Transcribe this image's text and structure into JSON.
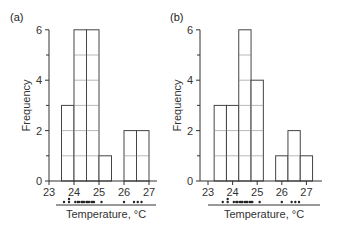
{
  "chart_data": [
    {
      "type": "bar",
      "panel_label": "(a)",
      "title": "",
      "xlabel": "Temperature, °C",
      "ylabel": "Frequency",
      "xticks": [
        23,
        24,
        25,
        26,
        27
      ],
      "yticks": [
        0,
        2,
        4,
        6
      ],
      "ylim": [
        0,
        6
      ],
      "xlim": [
        23,
        27.3
      ],
      "bin_width": 0.5,
      "bins": [
        {
          "start": 23.5,
          "end": 24.0,
          "count": 3
        },
        {
          "start": 24.0,
          "end": 24.5,
          "count": 6
        },
        {
          "start": 24.5,
          "end": 25.0,
          "count": 6
        },
        {
          "start": 25.0,
          "end": 25.5,
          "count": 1
        },
        {
          "start": 25.5,
          "end": 26.0,
          "count": 0
        },
        {
          "start": 26.0,
          "end": 26.5,
          "count": 2
        },
        {
          "start": 26.5,
          "end": 27.0,
          "count": 2
        }
      ],
      "rug_points": [
        23.6,
        23.8,
        23.8,
        24.05,
        24.15,
        24.2,
        24.3,
        24.35,
        24.4,
        24.5,
        24.55,
        24.6,
        24.7,
        24.75,
        24.8,
        25.1,
        26.0,
        26.4,
        26.55,
        26.7
      ]
    },
    {
      "type": "bar",
      "panel_label": "(b)",
      "title": "",
      "xlabel": "Temperature, °C",
      "ylabel": "Frequency",
      "xticks": [
        23,
        24,
        25,
        26,
        27
      ],
      "yticks": [
        0,
        2,
        4,
        6
      ],
      "ylim": [
        0,
        6
      ],
      "xlim": [
        22.7,
        27.6
      ],
      "bin_width": 0.5,
      "bins": [
        {
          "start": 23.25,
          "end": 23.75,
          "count": 3
        },
        {
          "start": 23.75,
          "end": 24.25,
          "count": 3
        },
        {
          "start": 24.25,
          "end": 24.75,
          "count": 6
        },
        {
          "start": 24.75,
          "end": 25.25,
          "count": 4
        },
        {
          "start": 25.25,
          "end": 25.75,
          "count": 0
        },
        {
          "start": 25.75,
          "end": 26.25,
          "count": 1
        },
        {
          "start": 26.25,
          "end": 26.75,
          "count": 2
        },
        {
          "start": 26.75,
          "end": 27.25,
          "count": 1
        }
      ],
      "rug_points": [
        23.6,
        23.8,
        23.8,
        24.05,
        24.15,
        24.2,
        24.3,
        24.35,
        24.4,
        24.5,
        24.55,
        24.6,
        24.7,
        24.75,
        24.8,
        25.1,
        26.0,
        26.4,
        26.55,
        26.7
      ]
    }
  ],
  "layout": {
    "panels": [
      {
        "y_axis_x": 49,
        "x0_value": 23,
        "x0_px": 49,
        "px_per_unit_x": 25,
        "baseline_y": 181,
        "px_per_unit_y": 25.2,
        "x_axis_end": 157,
        "rug_line": [
          56,
          156
        ],
        "rug_y": 202,
        "label_pos": [
          10,
          21
        ],
        "ylabel_x": 30
      },
      {
        "y_axis_x": 200,
        "x0_value": 23,
        "x0_px": 208,
        "px_per_unit_x": 24.6,
        "baseline_y": 181,
        "px_per_unit_y": 25.2,
        "x_axis_end": 322,
        "rug_line": [
          208,
          320
        ],
        "rug_y": 202,
        "label_pos": [
          170,
          21
        ],
        "ylabel_x": 181
      }
    ]
  }
}
